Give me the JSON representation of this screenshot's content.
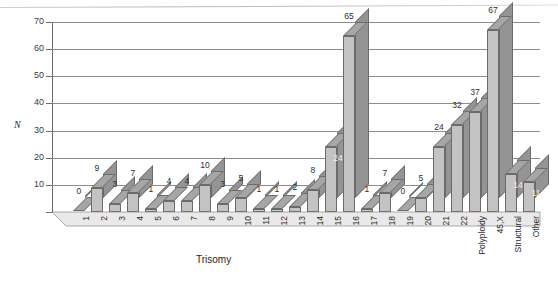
{
  "chart_data": {
    "type": "bar",
    "title": "",
    "subtitle": "",
    "xlabel": "Trisomy",
    "ylabel": "N",
    "ylim": [
      0,
      70
    ],
    "yticks": [
      0,
      10,
      20,
      30,
      40,
      50,
      60,
      70
    ],
    "grid": true,
    "legend": "none",
    "style": "3d-bars-grayscale",
    "categories": [
      "1",
      "2",
      "3",
      "4",
      "5",
      "6",
      "7",
      "8",
      "9",
      "10",
      "11",
      "12",
      "13",
      "14",
      "15",
      "16",
      "17",
      "18",
      "19",
      "20",
      "21",
      "22",
      "Polyploidy",
      "45,X",
      "Structural",
      "Other"
    ],
    "values": [
      0,
      9,
      3,
      7,
      1,
      4,
      4,
      10,
      3,
      5,
      1,
      1,
      2,
      8,
      24,
      65,
      1,
      7,
      0,
      5,
      24,
      32,
      37,
      67,
      14,
      11
    ],
    "data_labels": [
      "0",
      "9",
      "3",
      "7",
      "1",
      "4",
      "4",
      "10",
      "3",
      "5",
      "1",
      "1",
      "2",
      "8",
      "24",
      "65",
      "1",
      "7",
      "0",
      "5",
      "24",
      "32",
      "37",
      "67",
      "14",
      "11"
    ],
    "label_inside": [
      false,
      false,
      false,
      false,
      false,
      false,
      false,
      false,
      false,
      false,
      false,
      false,
      false,
      false,
      true,
      false,
      false,
      false,
      false,
      true,
      false,
      false,
      false,
      false,
      true,
      true
    ]
  },
  "axis": {
    "y_title": "N",
    "x_title": "Trisomy",
    "y_tick_labels": [
      "70",
      "60",
      "50",
      "40",
      "30",
      "20",
      "10",
      "0"
    ]
  },
  "colors": {
    "bar_front": "#c3c3c3",
    "bar_side": "#949494",
    "bar_top": "#a6a6a6",
    "bar_outline": "#6b6b6b",
    "gridline": "#8e8e8e",
    "axis": "#6d6d6d",
    "text": "#2e2e2e",
    "background": "#ffffff"
  }
}
